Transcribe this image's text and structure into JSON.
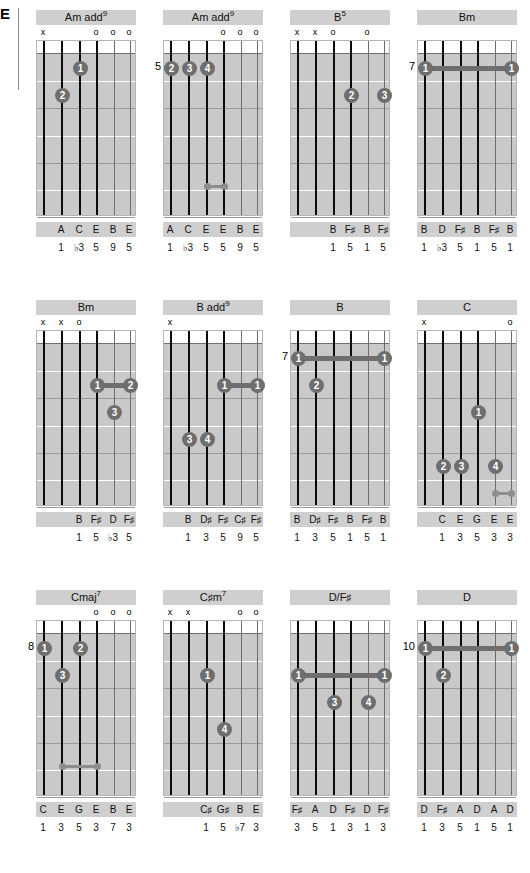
{
  "page": {
    "edge_letter": "E",
    "background": "#ffffff",
    "title_band_color": "#cfcfcf",
    "board_color": "#c9c9c9",
    "dot_color": "#6e6e6e",
    "string_color": "#0b0b0b",
    "columns": 4,
    "rows": 3,
    "strings": 6,
    "frets": 6
  },
  "chords": [
    {
      "name": "Am add",
      "superscript": "9",
      "position": "",
      "marks": [
        "x",
        "",
        "",
        "o",
        "o",
        "o"
      ],
      "dots": [
        {
          "string": 3,
          "fret": 1,
          "finger": "1"
        },
        {
          "string": 2,
          "fret": 2,
          "finger": "2"
        }
      ],
      "barres": [],
      "unisons": [],
      "notes": [
        "",
        "A",
        "C",
        "E",
        "B",
        "E"
      ],
      "intervals": [
        "",
        "1",
        "♭3",
        "5",
        "9",
        "5"
      ]
    },
    {
      "name": "Am add",
      "superscript": "9",
      "position": "5",
      "marks": [
        "",
        "",
        "",
        "o",
        "o",
        "o"
      ],
      "dots": [
        {
          "string": 1,
          "fret": 1,
          "finger": "2"
        },
        {
          "string": 2,
          "fret": 1,
          "finger": "3"
        },
        {
          "string": 3,
          "fret": 1,
          "finger": "4"
        }
      ],
      "barres": [],
      "unisons": [
        {
          "from": 3,
          "to": 4,
          "fret": 5.35
        }
      ],
      "notes": [
        "A",
        "C",
        "E",
        "E",
        "B",
        "E"
      ],
      "intervals": [
        "1",
        "♭3",
        "5",
        "5",
        "9",
        "5"
      ]
    },
    {
      "name": "B",
      "superscript": "5",
      "position": "",
      "marks": [
        "x",
        "x",
        "o",
        "",
        "o",
        ""
      ],
      "dots": [
        {
          "string": 4,
          "fret": 2,
          "finger": "2"
        },
        {
          "string": 6,
          "fret": 2,
          "finger": "3"
        }
      ],
      "barres": [],
      "unisons": [],
      "notes": [
        "",
        "",
        "B",
        "F♯",
        "B",
        "F♯"
      ],
      "intervals": [
        "",
        "",
        "1",
        "5",
        "1",
        "5"
      ]
    },
    {
      "name": "Bm",
      "superscript": "",
      "position": "7",
      "marks": [
        "",
        "",
        "",
        "",
        "",
        ""
      ],
      "dots": [
        {
          "string": 1,
          "fret": 1,
          "finger": "1"
        },
        {
          "string": 6,
          "fret": 1,
          "finger": "1"
        }
      ],
      "barres": [
        {
          "from": 1,
          "to": 6,
          "fret": 1
        }
      ],
      "unisons": [],
      "notes": [
        "B",
        "D",
        "F♯",
        "B",
        "F♯",
        "B"
      ],
      "intervals": [
        "1",
        "♭3",
        "5",
        "1",
        "5",
        "1"
      ]
    },
    {
      "name": "Bm",
      "superscript": "",
      "position": "",
      "marks": [
        "x",
        "x",
        "o",
        "",
        "",
        ""
      ],
      "dots": [
        {
          "string": 4,
          "fret": 2,
          "finger": "1"
        },
        {
          "string": 6,
          "fret": 2,
          "finger": "2"
        },
        {
          "string": 5,
          "fret": 3,
          "finger": "3"
        }
      ],
      "barres": [
        {
          "from": 4,
          "to": 6,
          "fret": 2
        }
      ],
      "unisons": [],
      "notes": [
        "",
        "",
        "B",
        "F♯",
        "D",
        "F♯"
      ],
      "intervals": [
        "",
        "",
        "1",
        "5",
        "♭3",
        "5"
      ]
    },
    {
      "name": "B add",
      "superscript": "9",
      "position": "",
      "marks": [
        "x",
        "",
        "",
        "",
        "",
        ""
      ],
      "dots": [
        {
          "string": 4,
          "fret": 2,
          "finger": "1"
        },
        {
          "string": 6,
          "fret": 2,
          "finger": "1"
        },
        {
          "string": 2,
          "fret": 4,
          "finger": "3"
        },
        {
          "string": 3,
          "fret": 4,
          "finger": "4"
        }
      ],
      "barres": [
        {
          "from": 4,
          "to": 6,
          "fret": 2
        }
      ],
      "unisons": [],
      "notes": [
        "",
        "B",
        "D♯",
        "F♯",
        "C♯",
        "F♯"
      ],
      "intervals": [
        "",
        "1",
        "3",
        "5",
        "9",
        "5"
      ]
    },
    {
      "name": "B",
      "superscript": "",
      "position": "7",
      "marks": [
        "",
        "",
        "",
        "",
        "",
        ""
      ],
      "dots": [
        {
          "string": 1,
          "fret": 1,
          "finger": "1"
        },
        {
          "string": 6,
          "fret": 1,
          "finger": "1"
        },
        {
          "string": 2,
          "fret": 2,
          "finger": "2"
        }
      ],
      "barres": [
        {
          "from": 1,
          "to": 6,
          "fret": 1
        }
      ],
      "unisons": [],
      "notes": [
        "B",
        "D♯",
        "F♯",
        "B",
        "F♯",
        "B"
      ],
      "intervals": [
        "1",
        "3",
        "5",
        "1",
        "5",
        "1"
      ]
    },
    {
      "name": "C",
      "superscript": "",
      "position": "",
      "marks": [
        "x",
        "",
        "",
        "",
        "",
        "o"
      ],
      "dots": [
        {
          "string": 4,
          "fret": 3,
          "finger": "1"
        },
        {
          "string": 2,
          "fret": 5,
          "finger": "2"
        },
        {
          "string": 3,
          "fret": 5,
          "finger": "3"
        },
        {
          "string": 5,
          "fret": 5,
          "finger": "4"
        }
      ],
      "barres": [],
      "unisons": [
        {
          "from": 5,
          "to": 6,
          "fret": 6
        }
      ],
      "notes": [
        "",
        "C",
        "E",
        "G",
        "E",
        "E"
      ],
      "intervals": [
        "",
        "1",
        "3",
        "5",
        "3",
        "3"
      ]
    },
    {
      "name": "Cmaj",
      "superscript": "7",
      "position": "8",
      "marks": [
        "",
        "",
        "",
        "o",
        "o",
        "o"
      ],
      "dots": [
        {
          "string": 1,
          "fret": 1,
          "finger": "1"
        },
        {
          "string": 3,
          "fret": 1,
          "finger": "2"
        },
        {
          "string": 2,
          "fret": 2,
          "finger": "3"
        }
      ],
      "barres": [],
      "unisons": [
        {
          "from": 2,
          "to": 4,
          "fret": 5.35
        }
      ],
      "notes": [
        "C",
        "E",
        "G",
        "E",
        "B",
        "E"
      ],
      "intervals": [
        "1",
        "3",
        "5",
        "3",
        "7",
        "3"
      ]
    },
    {
      "name": "C♯m",
      "superscript": "7",
      "position": "",
      "marks": [
        "x",
        "x",
        "",
        "",
        "o",
        "o"
      ],
      "dots": [
        {
          "string": 3,
          "fret": 2,
          "finger": "1"
        },
        {
          "string": 4,
          "fret": 4,
          "finger": "4"
        }
      ],
      "barres": [],
      "unisons": [],
      "notes": [
        "",
        "",
        "C♯",
        "G♯",
        "B",
        "E"
      ],
      "intervals": [
        "",
        "",
        "1",
        "5",
        "♭7",
        "3"
      ]
    },
    {
      "name": "D/F♯",
      "superscript": "",
      "position": "",
      "marks": [
        "",
        "",
        "",
        "",
        "",
        ""
      ],
      "dots": [
        {
          "string": 1,
          "fret": 2,
          "finger": "1"
        },
        {
          "string": 6,
          "fret": 2,
          "finger": "1"
        },
        {
          "string": 3,
          "fret": 3,
          "finger": "3"
        },
        {
          "string": 5,
          "fret": 3,
          "finger": "4"
        }
      ],
      "barres": [
        {
          "from": 1,
          "to": 6,
          "fret": 2
        }
      ],
      "unisons": [],
      "notes": [
        "F♯",
        "A",
        "D",
        "F♯",
        "D",
        "F♯"
      ],
      "intervals": [
        "3",
        "5",
        "1",
        "3",
        "1",
        "3"
      ]
    },
    {
      "name": "D",
      "superscript": "",
      "position": "10",
      "marks": [
        "",
        "",
        "",
        "",
        "",
        ""
      ],
      "dots": [
        {
          "string": 1,
          "fret": 1,
          "finger": "1"
        },
        {
          "string": 6,
          "fret": 1,
          "finger": "1"
        },
        {
          "string": 2,
          "fret": 2,
          "finger": "2"
        }
      ],
      "barres": [
        {
          "from": 1,
          "to": 6,
          "fret": 1
        }
      ],
      "unisons": [],
      "notes": [
        "D",
        "F♯",
        "A",
        "D",
        "A",
        "D"
      ],
      "intervals": [
        "1",
        "3",
        "5",
        "1",
        "5",
        "1"
      ]
    }
  ]
}
